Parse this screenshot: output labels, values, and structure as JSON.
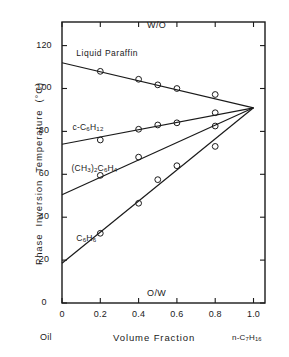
{
  "chart_data": {
    "type": "line",
    "title": "",
    "xlabel": "Volume Fraction",
    "ylabel": "Phase Inversion Temperature (°C)",
    "xlim": [
      0,
      1.06
    ],
    "ylim": [
      0,
      131
    ],
    "grid": false,
    "legend": "inline-labels",
    "x_ticks": [
      "0",
      "0.2",
      "0.4",
      "0.6",
      "0.8",
      "1.0"
    ],
    "x_tick_values": [
      0,
      0.2,
      0.4,
      0.6,
      0.8,
      1.0
    ],
    "y_ticks": [
      "0",
      "20",
      "40",
      "60",
      "80",
      "100",
      "120"
    ],
    "y_tick_values": [
      0,
      20,
      40,
      60,
      80,
      100,
      120
    ],
    "x_axis_left_caption": "Oil",
    "x_axis_right_caption": "n-C7H16",
    "region_label_top": "W/O",
    "region_label_bottom": "O/W",
    "convergence_point": {
      "x": 1.0,
      "y": 91
    },
    "series": [
      {
        "name": "Liquid Paraffin",
        "label": "Liquid Paraffin",
        "label_x": 0.075,
        "label_y": 116,
        "fit_line": {
          "x0": 0.0,
          "y0": 112.0,
          "x1": 1.0,
          "y1": 91.0
        },
        "points": [
          {
            "x": 0.2,
            "y": 108.0
          },
          {
            "x": 0.4,
            "y": 104.3
          },
          {
            "x": 0.5,
            "y": 101.7
          },
          {
            "x": 0.6,
            "y": 100.0
          },
          {
            "x": 0.8,
            "y": 97.2
          }
        ]
      },
      {
        "name": "c-C6H12",
        "label": "c-C6H12",
        "label_x": 0.055,
        "label_y": 81.5,
        "fit_line": {
          "x0": 0.0,
          "y0": 74.0,
          "x1": 1.0,
          "y1": 91.0
        },
        "points": [
          {
            "x": 0.2,
            "y": 76.0
          },
          {
            "x": 0.4,
            "y": 81.0
          },
          {
            "x": 0.5,
            "y": 83.0
          },
          {
            "x": 0.6,
            "y": 84.0
          },
          {
            "x": 0.8,
            "y": 88.7
          }
        ]
      },
      {
        "name": "(CH3)2C6H4",
        "label": "(CH3)2C6H4",
        "label_x": 0.05,
        "label_y": 62.5,
        "fit_line": {
          "x0": 0.0,
          "y0": 50.5,
          "x1": 1.0,
          "y1": 91.0
        },
        "points": [
          {
            "x": 0.2,
            "y": 59.5
          },
          {
            "x": 0.4,
            "y": 68.0
          },
          {
            "x": 0.8,
            "y": 82.5
          }
        ]
      },
      {
        "name": "C6H6",
        "label": "C6H6",
        "label_x": 0.075,
        "label_y": 30.0,
        "fit_line": {
          "x0": 0.0,
          "y0": 18.5,
          "x1": 1.0,
          "y1": 91.0
        },
        "points": [
          {
            "x": 0.2,
            "y": 32.5
          },
          {
            "x": 0.4,
            "y": 46.5
          },
          {
            "x": 0.5,
            "y": 57.5
          },
          {
            "x": 0.6,
            "y": 64.0
          },
          {
            "x": 0.8,
            "y": 73.0
          }
        ]
      }
    ]
  },
  "labels": {
    "liquid_paraffin": "Liquid Paraffin",
    "region_top": "W/O",
    "region_bottom": "O/W",
    "x_title": "Volume Fraction",
    "oil": "Oil"
  },
  "colors": {
    "ink": "#1a1a1a",
    "background": "#ffffff"
  }
}
